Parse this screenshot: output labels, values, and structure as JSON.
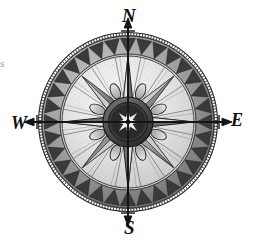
{
  "figure": {
    "style": "antique engraving",
    "background_color": "#ffffff"
  },
  "compass": {
    "cardinals": {
      "north": "N",
      "east": "E",
      "south": "S",
      "west": "W"
    },
    "edge_fragment": "s",
    "points": 8,
    "colors": {
      "ink": "#1a1a1a",
      "dark_gray": "#4a4a4a",
      "mid_gray": "#7d7d7d",
      "light_gray": "#b8b8b8",
      "pale": "#dcdcdc",
      "paper": "#efefef",
      "highlight": "#f7f7f7"
    },
    "geometry": {
      "center_x": 128,
      "center_y": 122,
      "outer_radius": 90,
      "tooth_ring_outer": 84,
      "tooth_ring_inner": 68,
      "face_radius": 66,
      "hub_radius": 25,
      "rosette_radius": 17,
      "needle_length": 110
    },
    "tooth_count": 32,
    "rhumb_line_count": 16
  }
}
